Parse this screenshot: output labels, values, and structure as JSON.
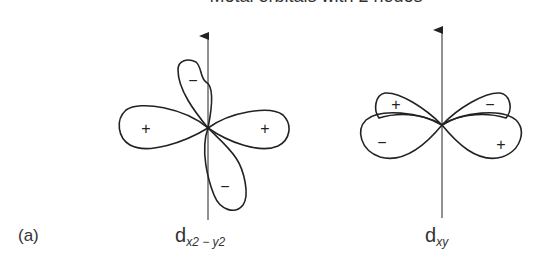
{
  "title": "Metal orbitals with 2 nodes",
  "panel_label": "(a)",
  "orbitals": [
    {
      "name": "d_x2-y2",
      "label_main": "d",
      "label_sub": "x2 − y2",
      "lobe_signs": {
        "left": "+",
        "right": "+",
        "top": "−",
        "bottom": "−"
      }
    },
    {
      "name": "d_xy",
      "label_main": "d",
      "label_sub": "xy",
      "lobe_signs": {
        "upper_left": "+",
        "upper_right": "−",
        "lower_left": "−",
        "lower_right": "+"
      }
    }
  ],
  "colors": {
    "line": "#222222",
    "text": "#333333",
    "background": "#ffffff"
  }
}
